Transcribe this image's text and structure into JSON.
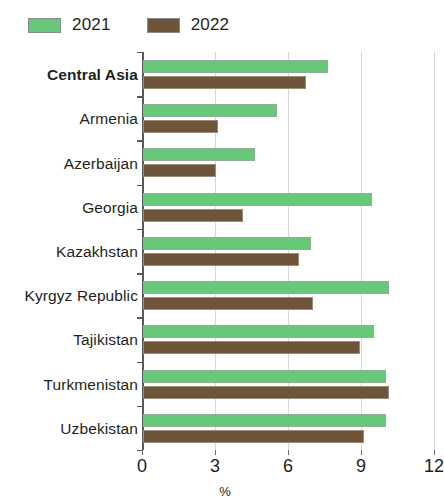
{
  "legend": {
    "entries": [
      {
        "label": "2021",
        "color": "#66c878",
        "icon": "legend-swatch-2021"
      },
      {
        "label": "2022",
        "color": "#6e5438",
        "icon": "legend-swatch-2022"
      }
    ]
  },
  "axis": {
    "x_ticks": [
      "0",
      "3",
      "6",
      "9",
      "12"
    ],
    "x_title": "%"
  },
  "chart_data": {
    "type": "bar",
    "orientation": "horizontal",
    "title": "",
    "subtitle": "",
    "xlabel": "%",
    "ylabel": "",
    "xlim": [
      0,
      12
    ],
    "xticks": [
      0,
      3,
      6,
      9,
      12
    ],
    "grid": "vertical",
    "legend_position": "top-left",
    "categories": [
      "Central Asia",
      "Armenia",
      "Azerbaijan",
      "Georgia",
      "Kazakhstan",
      "Kyrgyz Republic",
      "Tajikistan",
      "Turkmenistan",
      "Uzbekistan"
    ],
    "emphasized_categories": [
      "Central Asia"
    ],
    "series": [
      {
        "name": "2021",
        "color": "#66c878",
        "values": [
          7.6,
          5.5,
          4.6,
          9.4,
          6.9,
          10.1,
          9.5,
          10.0,
          10.0
        ]
      },
      {
        "name": "2022",
        "color": "#6e5438",
        "values": [
          6.7,
          3.1,
          3.0,
          4.1,
          6.4,
          7.0,
          8.9,
          10.1,
          9.1
        ]
      }
    ]
  }
}
